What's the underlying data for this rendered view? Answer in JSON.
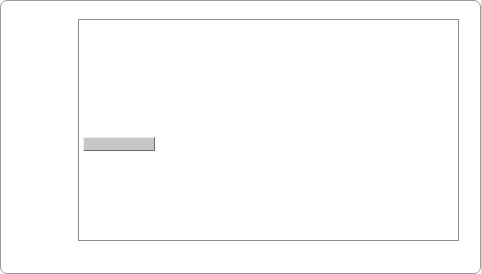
{
  "chart_data": {
    "type": "area",
    "stacked": true,
    "title": "",
    "xlabel": "",
    "ylabel": "Vehicle Sales (1000s/yr)",
    "xlim": [
      2010,
      2050
    ],
    "ylim": [
      0,
      25000
    ],
    "xticks": [
      2010,
      2015,
      2020,
      2025,
      2030,
      2035,
      2040,
      2045,
      2050
    ],
    "yticks": [
      0,
      5000,
      10000,
      15000,
      20000,
      25000
    ],
    "grid": true,
    "legend_position": "lower-left",
    "x": [
      2010,
      2011,
      2012,
      2013,
      2014,
      2015,
      2016,
      2017,
      2018,
      2019,
      2020,
      2021,
      2022,
      2023,
      2024,
      2025,
      2026,
      2027,
      2028,
      2029,
      2030,
      2031,
      2032,
      2033,
      2034,
      2035,
      2036,
      2037,
      2038,
      2039,
      2040,
      2041,
      2042,
      2043,
      2044,
      2045,
      2046,
      2047,
      2048,
      2049,
      2050
    ],
    "series": [
      {
        "name": "ICEs",
        "color": "#6e6e6e",
        "values": [
          10900,
          12200,
          13600,
          14900,
          15800,
          16050,
          15700,
          15750,
          15850,
          15600,
          15300,
          15150,
          15000,
          14850,
          14700,
          14500,
          14350,
          14200,
          14000,
          13800,
          13600,
          13400,
          13150,
          12900,
          12600,
          12300,
          11900,
          11450,
          11000,
          10600,
          10200,
          9800,
          9400,
          9000,
          8700,
          8450,
          8250,
          8050,
          7850,
          7700,
          7600
        ]
      },
      {
        "name": "HEVs",
        "color": "#737373",
        "values": [
          100,
          130,
          170,
          220,
          280,
          330,
          400,
          480,
          560,
          700,
          900,
          1100,
          1350,
          1600,
          1900,
          2200,
          2500,
          2800,
          3100,
          3450,
          3800,
          4150,
          4500,
          4850,
          5200,
          5500,
          5800,
          6050,
          6250,
          6450,
          6600,
          6750,
          6900,
          7050,
          7200,
          7350,
          7550,
          7750,
          7950,
          8150,
          8350
        ]
      },
      {
        "name": "PHEVs",
        "color": "#8c8c8c",
        "values": [
          20,
          30,
          45,
          60,
          80,
          100,
          130,
          170,
          210,
          260,
          320,
          380,
          450,
          520,
          580,
          640,
          700,
          750,
          800,
          850,
          900,
          940,
          980,
          1010,
          1040,
          1060,
          1080,
          1090,
          1100,
          1100,
          1100,
          1080,
          1060,
          1040,
          1020,
          1000,
          980,
          960,
          950,
          940,
          930
        ]
      },
      {
        "name": "BEVs",
        "color": "#5e5e5e",
        "values": [
          10,
          15,
          25,
          40,
          60,
          80,
          110,
          150,
          200,
          270,
          360,
          460,
          580,
          720,
          880,
          1060,
          1260,
          1480,
          1720,
          1980,
          2260,
          2560,
          2880,
          3220,
          3560,
          3900,
          4180,
          4400,
          4560,
          4660,
          4700,
          4720,
          4740,
          4760,
          4780,
          4800,
          4820,
          4840,
          4860,
          4880,
          4900
        ]
      },
      {
        "name": "FCEVs",
        "color": "#9c9c9c",
        "values": [
          0,
          0,
          0,
          0,
          5,
          10,
          15,
          20,
          30,
          45,
          60,
          80,
          100,
          125,
          150,
          180,
          210,
          240,
          270,
          300,
          330,
          360,
          390,
          420,
          450,
          480,
          500,
          520,
          535,
          545,
          550,
          555,
          560,
          565,
          570,
          575,
          580,
          585,
          590,
          595,
          600
        ]
      }
    ],
    "totals": [
      11030,
      12375,
      13840,
      15220,
      16225,
      16570,
      16355,
      16570,
      16850,
      16875,
      16940,
      17170,
      17480,
      17815,
      18210,
      18580,
      19020,
      19470,
      19890,
      20380,
      20890,
      21410,
      21900,
      22400,
      22850,
      23240,
      23460,
      23510,
      23445,
      23355,
      23150,
      23105,
      22660,
      22415,
      22270,
      22175,
      22180,
      22185,
      22200,
      22265,
      22380
    ]
  },
  "legend": {
    "items": [
      {
        "label": "FCEVs",
        "swatch_color": "#b4b4b4"
      },
      {
        "label": "BEVs",
        "swatch_color": "#7d7d7d"
      },
      {
        "label": "PHEVs",
        "swatch_color": "#c8c8c8"
      },
      {
        "label": "HEVs",
        "swatch_color": "#8a8a8a"
      },
      {
        "label": "ICEs",
        "swatch_color": "#9a9a9a"
      }
    ]
  }
}
